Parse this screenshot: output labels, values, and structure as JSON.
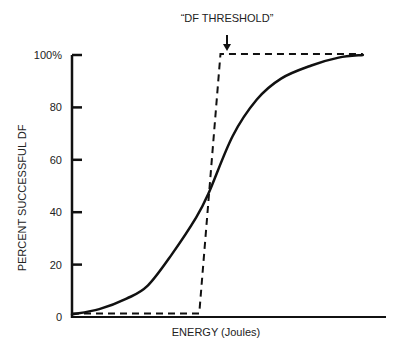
{
  "chart_data": {
    "type": "line",
    "title": "",
    "annotation": "“DF THRESHOLD”",
    "xlabel": "ENERGY (Joules)",
    "ylabel": "PERCENT SUCCESSFUL DF",
    "ylim": [
      0,
      100
    ],
    "xlim": [
      0,
      100
    ],
    "y_ticks": [
      {
        "value": 0,
        "label": "0"
      },
      {
        "value": 20,
        "label": "20"
      },
      {
        "value": 40,
        "label": "40"
      },
      {
        "value": 60,
        "label": "60"
      },
      {
        "value": 80,
        "label": "80"
      },
      {
        "value": 100,
        "label": "100%"
      }
    ],
    "x_ticks": [],
    "grid": false,
    "legend": null,
    "series": [
      {
        "name": "Actual dose-response curve (sigmoid)",
        "style": "solid",
        "x": [
          0,
          9,
          18,
          25,
          33,
          41,
          45,
          53,
          61,
          69,
          79,
          88,
          96
        ],
        "y": [
          1,
          3,
          7,
          12,
          24,
          38,
          47,
          69,
          83,
          91,
          96,
          99,
          100
        ]
      },
      {
        "name": "Idealized step threshold",
        "style": "dashed",
        "x": [
          0,
          42,
          49,
          96
        ],
        "y": [
          1,
          1,
          100,
          100
        ]
      }
    ],
    "colors": {
      "line": "#111111",
      "background": "#ffffff"
    }
  }
}
